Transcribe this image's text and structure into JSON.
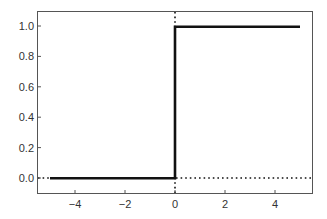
{
  "chart_data": {
    "type": "line",
    "title": "",
    "xlabel": "",
    "ylabel": "",
    "xlim": [
      -5.5,
      5.5
    ],
    "ylim": [
      -0.1,
      1.1
    ],
    "grid": false,
    "legend": null,
    "xticks": [
      -4,
      -2,
      0,
      2,
      4
    ],
    "xtick_labels": [
      "−4",
      "−2",
      "0",
      "2",
      "4"
    ],
    "yticks": [
      0.0,
      0.2,
      0.4,
      0.6,
      0.8,
      1.0
    ],
    "ytick_labels": [
      "0.0",
      "0.2",
      "0.4",
      "0.6",
      "0.8",
      "1.0"
    ],
    "series": [
      {
        "name": "step function",
        "style": "solid",
        "color": "#111111",
        "x": [
          -5,
          0,
          0,
          5
        ],
        "y": [
          0,
          0,
          1,
          1
        ]
      }
    ],
    "annotations": [
      {
        "type": "hline",
        "y": 0,
        "style": "dotted",
        "color": "#111111"
      },
      {
        "type": "vline",
        "x": 0,
        "style": "dotted",
        "color": "#111111"
      }
    ]
  }
}
